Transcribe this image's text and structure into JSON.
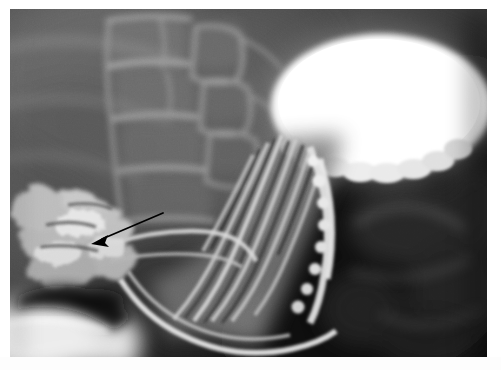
{
  "image": {
    "kind": "medical-radiograph",
    "modality": "Barium contrast study (fluoroscopic spot film)",
    "view": "Lateral / oblique upper gastrointestinal tract",
    "title": "",
    "caption": "",
    "alt_text": "Lateral barium swallow radiograph showing a barium-filled gastric fundus as a bright oval in the upper right, longitudinal mucosal folds of the distal esophagus descending toward the lower left, lumbar vertebral bodies behind, and a black arrow pointing down-and-left at an outpouching.",
    "dimensions": {
      "width": 501,
      "height": 370
    },
    "plate": {
      "x": 10,
      "y": 9,
      "width": 477,
      "height": 348
    }
  },
  "colors": {
    "paper": "#ffffff",
    "plate_background": "#0a0a0a",
    "barium_bright": "#ffffff",
    "barium_rim": "#efefef",
    "soft_tissue_mid": "#6e6e6e",
    "soft_tissue_dark": "#2a2a2a",
    "gas_black": "#0b0b0b",
    "bone_light": "#9a9a9a",
    "annotation_arrow": "#000000"
  },
  "annotations": [
    {
      "id": "pointer-arrow",
      "type": "arrow",
      "label": "",
      "color": "#000000",
      "tail": {
        "x": 163,
        "y": 213
      },
      "tip": {
        "x": 91,
        "y": 244
      },
      "head_length": 13,
      "head_width": 7,
      "shaft_width": 1.6,
      "points_at": "outpouching / diverticulum at the lower-left of the esophageal segment"
    }
  ],
  "anatomy": [
    {
      "id": "gastric-fundus",
      "name": "Barium-filled gastric fundus",
      "appearance": "bright white oval",
      "bbox": {
        "x": 262,
        "y": 24,
        "width": 218,
        "height": 146
      }
    },
    {
      "id": "esophageal-folds",
      "name": "Longitudinal mucosal folds of distal esophagus",
      "appearance": "parallel light striations running upper-right to lower-left",
      "bbox": {
        "x": 185,
        "y": 150,
        "width": 140,
        "height": 190
      }
    },
    {
      "id": "lumbar-spine",
      "name": "Vertebral bodies (lumbar spine)",
      "appearance": "stacked rectangular mid-gray blocks with lighter endplates",
      "bbox": {
        "x": 95,
        "y": 10,
        "width": 175,
        "height": 200
      }
    },
    {
      "id": "gastric-gas",
      "name": "Gas-filled stomach / bowel",
      "appearance": "broad dark region right of midline",
      "bbox": {
        "x": 330,
        "y": 175,
        "width": 157,
        "height": 182
      }
    },
    {
      "id": "outpouching",
      "name": "Mottled contrast-coated outpouching",
      "appearance": "bright irregular cluster at the lower left, indicated by arrow",
      "bbox": {
        "x": 18,
        "y": 180,
        "width": 120,
        "height": 120
      }
    }
  ],
  "texts": {
    "overlay_labels": [],
    "corner_markers": [],
    "caption_below_image": ""
  }
}
